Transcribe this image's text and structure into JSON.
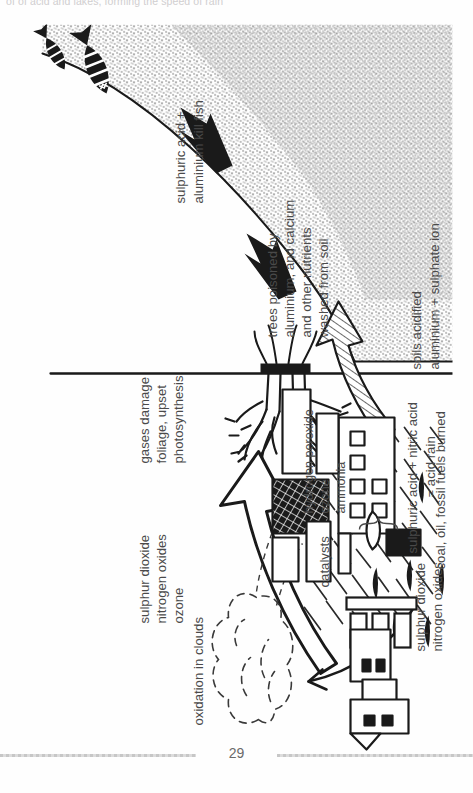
{
  "page": {
    "running_head": "of of acid and lakes, forming the speed of rain",
    "folio": "29"
  },
  "figure": {
    "labels": {
      "emission": "sulphur dioxide\nnitrogen oxides",
      "emission_line1": "sulphur dioxide",
      "emission_line2": "nitrogen oxides",
      "fuel_source": "coal, oil, fossil fuels burned",
      "transported_gases_line1": "sulphur dioxide",
      "transported_gases_line2": "nitrogen oxides",
      "transported_gases_line3": "ozone",
      "oxidation": "oxidation in clouds",
      "catalysts_bracket": "catalysts",
      "catalyst_1": "hydrogen peroxide",
      "catalyst_2": "ozone",
      "catalyst_3": "ammonia",
      "acids_line1": "sulphuric acid + nitric acid",
      "acids_line2": "= acid rain",
      "foliage_line1": "gases damage",
      "foliage_line2": "foliage, upset",
      "foliage_line3": "photosynthesis",
      "soil_line1": "soils acidified",
      "soil_line2": "aluminium + sulphate ion",
      "trees_line1": "trees poisoned by",
      "trees_line2": "aluminium, and calcium",
      "trees_line3": "and other nutrients",
      "trees_line4": "washed from soil",
      "fish_line1": "sulphuric acid +",
      "fish_line2": "aluminium kill fish"
    },
    "colors": {
      "ink": "#1a1a1a",
      "label_text": "#4a4a4a",
      "paper": "#fefefe",
      "rule": "#bdbdbd",
      "folio": "#6a6a6a",
      "stipple": "#2b2b2b"
    },
    "elements": [
      "smoke-stacks",
      "factory-buildings",
      "city-skyline",
      "wavy-emission-lines",
      "cloud-outline",
      "rain-hatching",
      "big-outline-arrow-to-foliage",
      "tree-with-roots",
      "hatched-arrow-into-soil",
      "solid-arrow-trees",
      "solid-arrow-lake",
      "dead-fish",
      "water-surface-line",
      "stippled-ground"
    ]
  }
}
